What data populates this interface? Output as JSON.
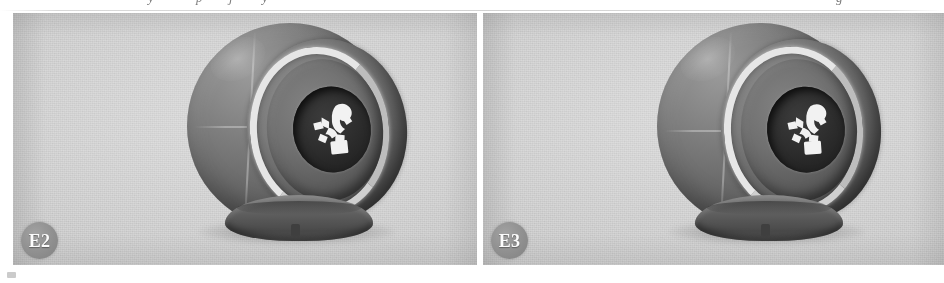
{
  "figure": {
    "kind": "two-panel grayscale photograph figure",
    "panel_count": 2,
    "background_color": "#ffffff",
    "photo_background_color": "#c9c9c9",
    "badge_color": "#8f8f8f",
    "badge_text_color": "#fbfbfb",
    "cropped_caption_fragments": [
      {
        "text": "y",
        "left": 148
      },
      {
        "text": "p",
        "left": 196
      },
      {
        "text": "j",
        "left": 229
      },
      {
        "text": "y",
        "left": 262
      },
      {
        "text": "·",
        "left": 318
      },
      {
        "text": "·",
        "left": 758
      },
      {
        "text": "g",
        "left": 836
      },
      {
        "text": "·",
        "left": 905
      }
    ],
    "panels": [
      {
        "id": "panel-e2",
        "label": "E2",
        "subject_name": "spherical display device on pedestal base",
        "emblem_description": "white abstract figure emblem in recessed dark circular lens"
      },
      {
        "id": "panel-e3",
        "label": "E3",
        "subject_name": "spherical display device on pedestal base",
        "emblem_description": "white abstract figure emblem in recessed dark circular lens"
      }
    ]
  }
}
